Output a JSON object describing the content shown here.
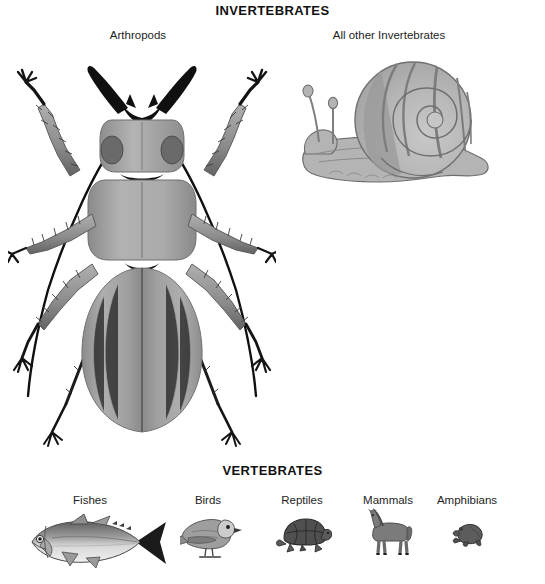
{
  "figure": {
    "kind": "biology-classification-illustration",
    "background_color": "#ffffff",
    "text_color": "#1a1a1a"
  },
  "sections": {
    "invertebrates": {
      "title": "INVERTEBRATES",
      "groups": [
        {
          "label": "Arthropods",
          "organism": "ground-beetle"
        },
        {
          "label": "All other Invertebrates",
          "organism": "land-snail"
        }
      ]
    },
    "vertebrates": {
      "title": "VERTEBRATES",
      "groups": [
        {
          "label": "Fishes",
          "organism": "tuna-fish"
        },
        {
          "label": "Birds",
          "organism": "perching-bird"
        },
        {
          "label": "Reptiles",
          "organism": "tortoise"
        },
        {
          "label": "Mammals",
          "organism": "horse"
        },
        {
          "label": "Amphibians",
          "organism": "frog"
        }
      ]
    }
  },
  "palette": {
    "ink_black": "#111111",
    "outline": "#4a4a4a",
    "beetle_body": "#9a9a9a",
    "beetle_body_light": "#b9b9b9",
    "beetle_body_dark": "#6f6f6f",
    "beetle_black": "#111111",
    "snail_body": "#b4b4b4",
    "snail_shell_light": "#c2c2c2",
    "snail_shell_band": "#8d8d8d",
    "snail_outline": "#6b6b6b",
    "fish_light": "#dcdcdc",
    "fish_mid": "#a8a8a8",
    "fish_dark": "#5a5a5a",
    "bird_gray": "#9c9c9c",
    "bird_light": "#cfcfcf",
    "turtle_dark": "#4f4f4f",
    "horse_gray": "#7b7b7b",
    "frog_dark": "#5c5c5c"
  }
}
